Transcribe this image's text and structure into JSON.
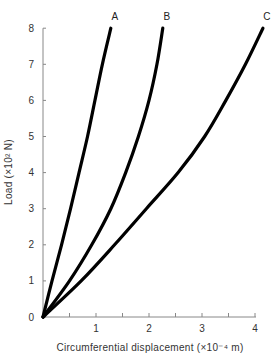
{
  "chart_data": {
    "type": "line",
    "title": "",
    "xlabel": "Circumferential displacement (×10⁻⁴ m)",
    "ylabel": "Load (×10² N)",
    "xlim": [
      0,
      4.2
    ],
    "ylim": [
      0,
      8
    ],
    "xticks": [
      0,
      1,
      2,
      3,
      4
    ],
    "xtick_labels": [
      "",
      "1",
      "2",
      "3",
      "4"
    ],
    "x_minor_ticks": [
      0.5,
      1.5,
      2.5,
      3.5
    ],
    "yticks": [
      0,
      1,
      2,
      3,
      4,
      5,
      6,
      7,
      8
    ],
    "ytick_labels": [
      "0",
      "1",
      "2",
      "3",
      "4",
      "5",
      "6",
      "7",
      "8"
    ],
    "grid": false,
    "legend": "none (curves labeled directly at top)",
    "series": [
      {
        "name": "A",
        "x": [
          0,
          0.17,
          0.35,
          0.52,
          0.68,
          0.84,
          0.98,
          1.12,
          1.28
        ],
        "y": [
          0,
          1,
          2,
          3,
          4,
          5,
          6,
          7,
          8
        ]
      },
      {
        "name": "B",
        "x": [
          0,
          0.5,
          0.92,
          1.28,
          1.56,
          1.8,
          2.0,
          2.15,
          2.26
        ],
        "y": [
          0,
          1,
          2,
          3,
          4,
          5,
          6,
          7,
          8
        ]
      },
      {
        "name": "C",
        "x": [
          0,
          0.72,
          1.35,
          1.95,
          2.55,
          3.05,
          3.45,
          3.82,
          4.15
        ],
        "y": [
          0,
          1,
          2,
          3,
          4,
          5,
          6,
          7,
          8
        ]
      }
    ],
    "colors": {
      "curve": "#000000",
      "axis": "#888888",
      "text": "#333333"
    }
  }
}
